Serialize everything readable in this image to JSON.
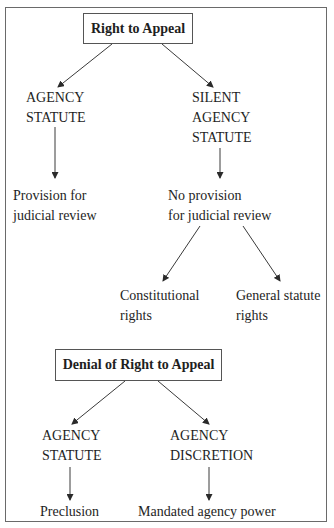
{
  "caption": "Figure: Right to Appeal and Denial of Right to Appeal",
  "diagram": {
    "top_section": {
      "root": "Right to Appeal",
      "left_branch": {
        "node": [
          "AGENCY",
          "STATUTE"
        ],
        "child": [
          "Provision for",
          "judicial review"
        ]
      },
      "right_branch": {
        "node": [
          "SILENT",
          "AGENCY",
          "STATUTE"
        ],
        "child": [
          "No provision",
          "for judicial review"
        ],
        "children": [
          {
            "label": [
              "Constitutional",
              "rights"
            ]
          },
          {
            "label": [
              "General statute",
              "rights"
            ]
          }
        ]
      }
    },
    "bottom_section": {
      "root": "Denial of Right to Appeal",
      "left_branch": {
        "node": [
          "AGENCY",
          "STATUTE"
        ],
        "child": "Preclusion"
      },
      "right_branch": {
        "node": [
          "AGENCY",
          "DISCRETION"
        ],
        "child": "Mandated agency power"
      }
    }
  },
  "colors": {
    "line": "#3a3a3a",
    "frame": "#6a6a6a",
    "text": "#1e1e1e"
  }
}
